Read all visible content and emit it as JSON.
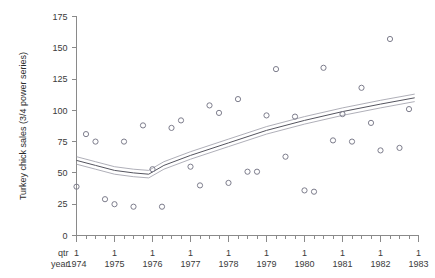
{
  "chart_data": {
    "type": "scatter",
    "title": "",
    "xlabel": "",
    "ylabel": "Turkey chick sales (3/4 power series)",
    "ylim": [
      0,
      175
    ],
    "yticks": [
      0,
      25,
      50,
      75,
      100,
      125,
      150,
      175
    ],
    "ytick_labels": [
      "0",
      "25",
      "50",
      "75",
      "100",
      "125",
      "150",
      "175"
    ],
    "grid": false,
    "legend": "none",
    "x_axis_rows": [
      {
        "label": "qtr",
        "values": [
          "1",
          "1",
          "1",
          "1",
          "1",
          "1",
          "1",
          "1",
          "1",
          "1"
        ]
      },
      {
        "label": "year",
        "values": [
          "1974",
          "1975",
          "1976",
          "1977",
          "1978",
          "1979",
          "1980",
          "1981",
          "1982",
          "1983"
        ]
      }
    ],
    "x_minor_ticks_per_year": 4,
    "x_range_years": [
      1974,
      1983
    ],
    "series": [
      {
        "name": "observed",
        "marker": "open-circle",
        "points": [
          {
            "t": 1974.0,
            "y": 39
          },
          {
            "t": 1974.25,
            "y": 81
          },
          {
            "t": 1974.5,
            "y": 75
          },
          {
            "t": 1974.75,
            "y": 29
          },
          {
            "t": 1975.0,
            "y": 25
          },
          {
            "t": 1975.25,
            "y": 75
          },
          {
            "t": 1975.5,
            "y": 23
          },
          {
            "t": 1975.75,
            "y": 88
          },
          {
            "t": 1976.0,
            "y": 53
          },
          {
            "t": 1976.25,
            "y": 23
          },
          {
            "t": 1976.5,
            "y": 86
          },
          {
            "t": 1976.75,
            "y": 92
          },
          {
            "t": 1977.0,
            "y": 55
          },
          {
            "t": 1977.25,
            "y": 40
          },
          {
            "t": 1977.5,
            "y": 104
          },
          {
            "t": 1977.75,
            "y": 98
          },
          {
            "t": 1978.0,
            "y": 42
          },
          {
            "t": 1978.25,
            "y": 109
          },
          {
            "t": 1978.5,
            "y": 51
          },
          {
            "t": 1978.75,
            "y": 51
          },
          {
            "t": 1979.0,
            "y": 96
          },
          {
            "t": 1979.25,
            "y": 133
          },
          {
            "t": 1979.5,
            "y": 63
          },
          {
            "t": 1979.75,
            "y": 95
          },
          {
            "t": 1980.0,
            "y": 36
          },
          {
            "t": 1980.25,
            "y": 35
          },
          {
            "t": 1980.5,
            "y": 134
          },
          {
            "t": 1980.75,
            "y": 76
          },
          {
            "t": 1981.0,
            "y": 97
          },
          {
            "t": 1981.25,
            "y": 75
          },
          {
            "t": 1981.5,
            "y": 118
          },
          {
            "t": 1981.75,
            "y": 90
          },
          {
            "t": 1982.0,
            "y": 68
          },
          {
            "t": 1982.25,
            "y": 157
          },
          {
            "t": 1982.5,
            "y": 70
          },
          {
            "t": 1982.75,
            "y": 101
          }
        ]
      },
      {
        "name": "fitted-trend",
        "style": "solid-line",
        "points": [
          {
            "t": 1974.0,
            "y": 60
          },
          {
            "t": 1974.5,
            "y": 56
          },
          {
            "t": 1975.0,
            "y": 52
          },
          {
            "t": 1975.5,
            "y": 50
          },
          {
            "t": 1975.9,
            "y": 49
          },
          {
            "t": 1976.3,
            "y": 56
          },
          {
            "t": 1977.0,
            "y": 64
          },
          {
            "t": 1978.0,
            "y": 74
          },
          {
            "t": 1979.0,
            "y": 84
          },
          {
            "t": 1980.0,
            "y": 92
          },
          {
            "t": 1981.0,
            "y": 99
          },
          {
            "t": 1982.0,
            "y": 105
          },
          {
            "t": 1982.9,
            "y": 110
          }
        ]
      },
      {
        "name": "confidence-upper",
        "style": "thin-line",
        "offset": 3
      },
      {
        "name": "confidence-lower",
        "style": "thin-line",
        "offset": -3
      }
    ]
  },
  "colors": {
    "axis": "#8a8a8a",
    "point": "#7d7d8c",
    "fit_line": "#55555f",
    "ci_line": "#9b9ba6",
    "text": "#3a3a3a",
    "background": "#ffffff"
  }
}
